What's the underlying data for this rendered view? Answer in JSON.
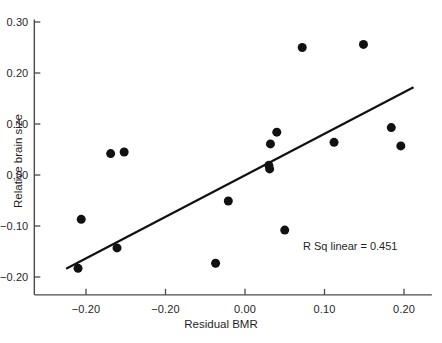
{
  "chart_data": {
    "type": "scatter",
    "title": "",
    "xlabel": "Residual BMR",
    "ylabel": "Relative brain size",
    "xlim": [
      -0.265,
      0.235
    ],
    "ylim": [
      -0.235,
      0.305
    ],
    "xticks": [
      -0.2,
      -0.1,
      0.0,
      0.1,
      0.2
    ],
    "xticklabels": [
      "-0.20",
      "-0.20",
      "0.00",
      "0.10",
      "0.20"
    ],
    "yticks": [
      -0.2,
      -0.1,
      0.0,
      0.1,
      0.2,
      0.3
    ],
    "yticklabels": [
      "-0.20",
      "-0.10",
      "0.00",
      "0.10",
      "0.20",
      "0.30"
    ],
    "grid": false,
    "legend": null,
    "marker": {
      "shape": "circle",
      "color": "#111111",
      "size_px": 9
    },
    "points": [
      {
        "x": -0.161,
        "y": -0.143
      },
      {
        "x": -0.21,
        "y": -0.183
      },
      {
        "x": -0.206,
        "y": -0.087
      },
      {
        "x": -0.169,
        "y": 0.042
      },
      {
        "x": -0.152,
        "y": 0.045
      },
      {
        "x": -0.037,
        "y": -0.173
      },
      {
        "x": -0.021,
        "y": -0.051
      },
      {
        "x": 0.03,
        "y": 0.019
      },
      {
        "x": 0.031,
        "y": 0.012
      },
      {
        "x": 0.032,
        "y": 0.061
      },
      {
        "x": 0.04,
        "y": 0.084
      },
      {
        "x": 0.05,
        "y": -0.108
      },
      {
        "x": 0.072,
        "y": 0.25
      },
      {
        "x": 0.112,
        "y": 0.064
      },
      {
        "x": 0.149,
        "y": 0.256
      },
      {
        "x": 0.184,
        "y": 0.093
      },
      {
        "x": 0.196,
        "y": 0.057
      }
    ],
    "fit_line": {
      "type": "linear",
      "r_squared": 0.451,
      "annotation": "R Sq linear = 0.451",
      "x_start": -0.225,
      "y_start": -0.184,
      "x_end": 0.212,
      "y_end": 0.172,
      "color": "#111111",
      "width_px": 2.2
    },
    "axis": {
      "color": "#4a4a4a",
      "spine_left": true,
      "spine_bottom": true,
      "spine_top": false,
      "spine_right": false
    }
  }
}
